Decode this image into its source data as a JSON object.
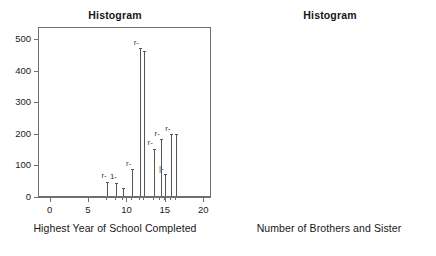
{
  "figure": {
    "panels": [
      {
        "id": "left",
        "title": "Histogram",
        "xlabel": "Highest Year of School Completed",
        "yticks": [
          "0",
          "100",
          "200",
          "300",
          "400",
          "500"
        ],
        "xticks": [
          "0",
          "5",
          "10",
          "15",
          "20"
        ]
      },
      {
        "id": "right",
        "title": "Histogram",
        "xlabel": "Number of Brothers and Sister",
        "yticks": [
          "0",
          "100",
          "200",
          "300"
        ],
        "xticks": [
          "0",
          "5",
          "10",
          "15"
        ]
      }
    ]
  },
  "chart_data": [
    {
      "type": "bar",
      "title": "Histogram",
      "xlabel": "Highest Year of School Completed",
      "ylabel": "",
      "xlim": [
        -1.5,
        21
      ],
      "ylim": [
        0,
        540
      ],
      "xticks": [
        0,
        5,
        10,
        15,
        20
      ],
      "yticks": [
        0,
        100,
        200,
        300,
        400,
        500
      ],
      "grid": false,
      "legend": null,
      "x": [
        7.4,
        8.5,
        9.4,
        10.6,
        11.6,
        12.1,
        13.4,
        14.3,
        14.9,
        15.7,
        16.3
      ],
      "values": [
        45,
        42,
        26,
        85,
        470,
        462,
        150,
        180,
        70,
        196,
        196
      ],
      "bar_annotations": [
        "r-",
        "1-",
        "",
        "r-",
        "r-",
        "",
        "r-",
        "r-",
        "|-",
        "r-",
        ""
      ]
    },
    {
      "type": "bar",
      "title": "Histogram",
      "xlabel": "Number of Brothers and Sister",
      "ylabel": "",
      "xlim": [
        -1.2,
        17.5
      ],
      "ylim": [
        0,
        325
      ],
      "xticks": [
        0,
        5,
        10,
        15
      ],
      "yticks": [
        0,
        100,
        200,
        300
      ],
      "grid": false,
      "legend": null,
      "x": [
        -0.4,
        0.8,
        1.7,
        2.2,
        3.4,
        5.9,
        6.6,
        7.5,
        8.6,
        9.6
      ],
      "values": [
        78,
        237,
        277,
        274,
        210,
        120,
        82,
        70,
        55,
        38
      ],
      "bar_annotations": [
        "-",
        "",
        "-",
        "",
        "1-",
        "1-",
        "r-",
        "1-",
        "1-",
        "1-"
      ]
    }
  ]
}
